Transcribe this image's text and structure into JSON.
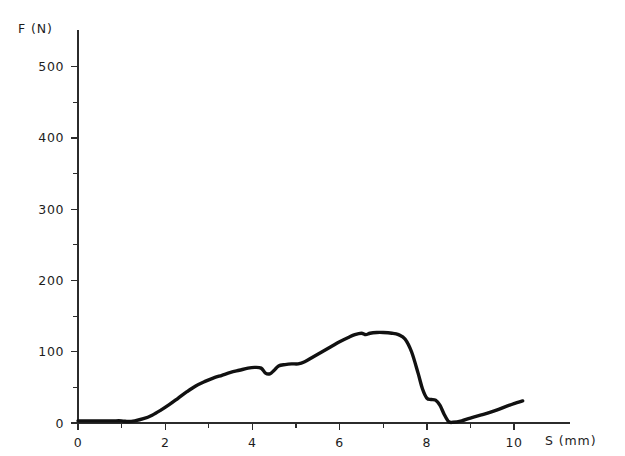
{
  "chart_data": {
    "type": "line",
    "title": "",
    "xlabel": "S (mm)",
    "ylabel": "F (N)",
    "xlim": [
      0,
      10.8
    ],
    "ylim": [
      0,
      550
    ],
    "grid": false,
    "legend": null,
    "x_ticks_major": [
      0,
      2,
      4,
      6,
      8,
      10
    ],
    "x_tick_labels": [
      "0",
      "2",
      "4",
      "6",
      "8",
      "10"
    ],
    "x_ticks_minor": [
      1,
      3,
      5,
      7,
      9
    ],
    "y_ticks_major": [
      0,
      100,
      200,
      300,
      400,
      500
    ],
    "y_tick_labels": [
      "0",
      "100",
      "200",
      "300",
      "400",
      "500"
    ],
    "y_ticks_minor": [
      50,
      150,
      250,
      350,
      450
    ],
    "series": [
      {
        "name": "force",
        "color": "#111111",
        "x": [
          0.0,
          0.2,
          0.4,
          0.6,
          0.8,
          1.0,
          1.15,
          1.3,
          1.5,
          1.7,
          1.9,
          2.1,
          2.3,
          2.5,
          2.7,
          2.9,
          3.1,
          3.3,
          3.5,
          3.7,
          3.9,
          4.05,
          4.2,
          4.3,
          4.4,
          4.5,
          4.6,
          4.75,
          4.9,
          5.05,
          5.2,
          5.4,
          5.6,
          5.8,
          6.0,
          6.2,
          6.35,
          6.5,
          6.6,
          6.7,
          6.85,
          7.0,
          7.2,
          7.35,
          7.5,
          7.65,
          7.8,
          7.9,
          8.0,
          8.1,
          8.2,
          8.3,
          8.4,
          8.5,
          8.6,
          8.8,
          9.0,
          9.3,
          9.6,
          9.9,
          10.2
        ],
        "y": [
          3,
          3,
          3,
          3,
          3,
          3,
          2,
          3,
          6,
          11,
          18,
          26,
          35,
          44,
          52,
          58,
          63,
          67,
          71,
          74,
          77,
          78,
          77,
          70,
          69,
          74,
          80,
          82,
          83,
          83,
          86,
          93,
          100,
          107,
          114,
          120,
          124,
          126,
          124,
          126,
          127,
          127,
          126,
          124,
          118,
          100,
          70,
          48,
          35,
          33,
          32,
          25,
          12,
          2,
          1,
          3,
          7,
          12,
          18,
          25,
          31
        ]
      }
    ],
    "annotations": []
  },
  "axis": {
    "y_title": "F (N)",
    "x_title": "S (mm)"
  }
}
